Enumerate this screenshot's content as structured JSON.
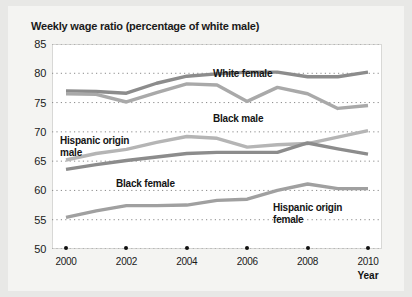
{
  "chart_data": {
    "type": "line",
    "title": "Weekly wage ratio (percentage of white male)",
    "xlabel": "Year",
    "ylabel": "",
    "x": [
      2000,
      2001,
      2002,
      2003,
      2004,
      2005,
      2006,
      2007,
      2008,
      2009,
      2010
    ],
    "xticks": [
      "2000",
      "2002",
      "2004",
      "2006",
      "2008",
      "2010"
    ],
    "xtick_values": [
      2000,
      2002,
      2004,
      2006,
      2008,
      2010
    ],
    "yticks": [
      "85",
      "80",
      "75",
      "70",
      "65",
      "60",
      "55",
      "50"
    ],
    "ytick_values": [
      85,
      80,
      75,
      70,
      65,
      60,
      55,
      50
    ],
    "ylim": [
      50,
      85
    ],
    "xlim": [
      2000,
      2010
    ],
    "grid": "horizontal-dotted",
    "legend": "inline-annotations",
    "series": [
      {
        "name": "White female",
        "color": "#8c8c8c",
        "values": [
          77.0,
          76.9,
          76.6,
          78.3,
          79.5,
          79.9,
          80.2,
          80.2,
          79.4,
          79.4,
          80.2
        ]
      },
      {
        "name": "Black male",
        "color": "#a9a9a9",
        "values": [
          76.5,
          76.4,
          75.1,
          76.7,
          78.2,
          78.0,
          75.2,
          77.6,
          76.5,
          74.0,
          74.5
        ]
      },
      {
        "name": "Hispanic origin male",
        "color": "#b5b5b5",
        "values": [
          65.2,
          66.3,
          67.0,
          68.2,
          69.2,
          68.9,
          67.4,
          67.8,
          68.0,
          69.1,
          70.2
        ]
      },
      {
        "name": "Black female",
        "color": "#8c8c8c",
        "values": [
          63.6,
          64.4,
          65.1,
          65.7,
          66.3,
          66.5,
          66.5,
          66.5,
          68.1,
          67.1,
          66.2
        ]
      },
      {
        "name": "Hispanic origin female",
        "color": "#a0a0a0",
        "values": [
          55.4,
          56.5,
          57.4,
          57.4,
          57.5,
          58.3,
          58.5,
          60.0,
          61.1,
          60.3,
          60.3
        ]
      }
    ],
    "annotations": [
      {
        "label": "White female",
        "x_px": 205,
        "y_px": 62
      },
      {
        "label": "Black male",
        "x_px": 205,
        "y_px": 107
      },
      {
        "label": "Hispanic origin\nmale",
        "x_px": 52,
        "y_px": 129
      },
      {
        "label": "Black female",
        "x_px": 108,
        "y_px": 172
      },
      {
        "label": "Hispanic origin\nfemale",
        "x_px": 265,
        "y_px": 196
      }
    ]
  }
}
